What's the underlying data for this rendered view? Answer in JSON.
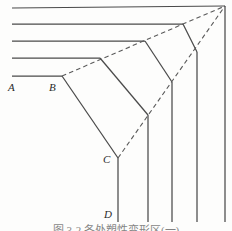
{
  "figure": {
    "caption": "图 3-2   各处塑性变形区(一)",
    "apex": {
      "x": 225,
      "y": 6,
      "name": "convergence-apex"
    },
    "stroke_color": "#4a4a4a",
    "dash_color": "#5a5a5a",
    "background": "#fdfdfc",
    "labels": [
      {
        "id": "A",
        "text": "A",
        "x": 8,
        "y": 82
      },
      {
        "id": "B",
        "text": "B",
        "x": 49,
        "y": 82
      },
      {
        "id": "C",
        "text": "C",
        "x": 103,
        "y": 154
      },
      {
        "id": "D",
        "text": "D",
        "x": 104,
        "y": 209
      }
    ],
    "horizontal_rays": [
      {
        "id": "h1",
        "x1": 12,
        "y1": 8,
        "x2": 225,
        "y2": 6
      },
      {
        "id": "h2",
        "x1": 12,
        "y1": 24,
        "x2": 183,
        "y2": 24
      },
      {
        "id": "h3",
        "x1": 12,
        "y1": 41,
        "x2": 145,
        "y2": 41
      },
      {
        "id": "h4",
        "x1": 12,
        "y1": 58,
        "x2": 100,
        "y2": 58
      },
      {
        "id": "h5",
        "x1": 12,
        "y1": 76,
        "x2": 62,
        "y2": 76
      }
    ],
    "vertical_rays": [
      {
        "id": "v1",
        "x1": 118,
        "y1": 158,
        "x2": 118,
        "y2": 222
      },
      {
        "id": "v2",
        "x1": 148,
        "y1": 115,
        "x2": 148,
        "y2": 222
      },
      {
        "id": "v3",
        "x1": 172,
        "y1": 82,
        "x2": 172,
        "y2": 222
      },
      {
        "id": "v4",
        "x1": 197,
        "y1": 52,
        "x2": 197,
        "y2": 222
      },
      {
        "id": "v5",
        "x1": 225,
        "y1": 6,
        "x2": 225,
        "y2": 222
      }
    ],
    "connector_arcs": [
      {
        "id": "c1",
        "x1": 62,
        "y1": 76,
        "x2": 118,
        "y2": 158
      },
      {
        "id": "c2",
        "x1": 100,
        "y1": 58,
        "x2": 148,
        "y2": 115
      },
      {
        "id": "c3",
        "x1": 145,
        "y1": 41,
        "x2": 172,
        "y2": 82
      },
      {
        "id": "c4",
        "x1": 183,
        "y1": 24,
        "x2": 197,
        "y2": 52
      }
    ],
    "dashed_rays": [
      {
        "id": "d-upper",
        "x1": 62,
        "y1": 76,
        "x2": 225,
        "y2": 6,
        "desc": "B-to-apex boundary"
      },
      {
        "id": "d-lower",
        "x1": 118,
        "y1": 158,
        "x2": 225,
        "y2": 6,
        "desc": "C-to-apex boundary"
      }
    ]
  }
}
